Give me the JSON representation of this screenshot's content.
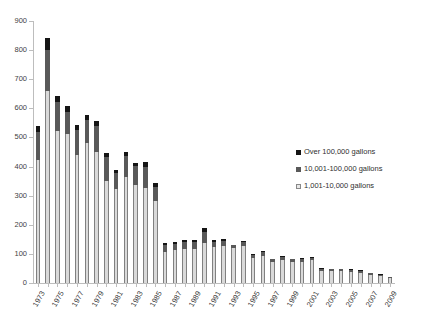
{
  "chart_data": {
    "type": "bar",
    "stacked": true,
    "title": "",
    "xlabel": "",
    "ylabel": "",
    "ylim": [
      0,
      900
    ],
    "ytick_step": 100,
    "yticks": [
      0,
      100,
      200,
      300,
      400,
      500,
      600,
      700,
      800,
      900
    ],
    "grid": false,
    "legend_position": "right-middle",
    "categories": [
      "1973",
      "1974",
      "1975",
      "1976",
      "1977",
      "1978",
      "1979",
      "1980",
      "1981",
      "1982",
      "1983",
      "1984",
      "1985",
      "1986",
      "1987",
      "1988",
      "1989",
      "1990",
      "1991",
      "1992",
      "1993",
      "1994",
      "1995",
      "1996",
      "1997",
      "1998",
      "1999",
      "2000",
      "2001",
      "2002",
      "2003",
      "2004",
      "2005",
      "2006",
      "2007",
      "2008",
      "2009"
    ],
    "tick_labels": [
      "1973",
      "",
      "1975",
      "",
      "1977",
      "",
      "1979",
      "",
      "1981",
      "",
      "1983",
      "",
      "1985",
      "",
      "1987",
      "",
      "1989",
      "",
      "1991",
      "",
      "1993",
      "",
      "1995",
      "",
      "1997",
      "",
      "1999",
      "",
      "2001",
      "",
      "2003",
      "",
      "2005",
      "",
      "2007",
      "",
      "2009"
    ],
    "series": [
      {
        "name": "1,001-10,000 gallons",
        "color": "#d9d9d9",
        "values": [
          422,
          661,
          523,
          511,
          439,
          482,
          449,
          352,
          322,
          365,
          338,
          328,
          283,
          105,
          113,
          117,
          116,
          136,
          123,
          126,
          120,
          128,
          85,
          92,
          73,
          78,
          73,
          73,
          78,
          42,
          41,
          40,
          38,
          36,
          29,
          24,
          17
        ]
      },
      {
        "name": "10,001-100,000 gallons",
        "color": "#595959",
        "values": [
          98,
          140,
          100,
          78,
          88,
          77,
          90,
          82,
          56,
          70,
          64,
          70,
          48,
          26,
          22,
          24,
          26,
          38,
          19,
          19,
          9,
          14,
          12,
          13,
          8,
          12,
          9,
          9,
          7,
          6,
          6,
          7,
          7,
          6,
          5,
          4,
          3
        ]
      },
      {
        "name": "Over 100,000 gallons",
        "color": "#151515",
        "values": [
          18,
          39,
          19,
          18,
          17,
          19,
          16,
          14,
          11,
          14,
          9,
          18,
          11,
          8,
          7,
          6,
          7,
          14,
          7,
          5,
          3,
          4,
          3,
          4,
          2,
          3,
          2,
          3,
          3,
          2,
          2,
          2,
          2,
          2,
          2,
          2,
          1
        ]
      }
    ],
    "totals": [
      538,
      840,
      642,
      607,
      544,
      578,
      555,
      448,
      389,
      449,
      411,
      416,
      342,
      139,
      142,
      147,
      149,
      188,
      149,
      150,
      132,
      146,
      100,
      109,
      83,
      93,
      84,
      85,
      88,
      50,
      49,
      49,
      47,
      44,
      36,
      30,
      21
    ]
  },
  "legend": {
    "items": [
      {
        "label": "Over 100,000 gallons",
        "swatch": "swatch-black"
      },
      {
        "label": "10,001-100,000 gallons",
        "swatch": "swatch-darkgray"
      },
      {
        "label": "1,001-10,000 gallons",
        "swatch": "swatch-lightgray"
      }
    ]
  }
}
